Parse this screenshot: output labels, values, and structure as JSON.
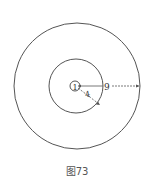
{
  "figure": {
    "caption": "图73",
    "circles": [
      {
        "name": "inner",
        "radius_label": "1",
        "cx": 76,
        "cy": 86,
        "r": 5
      },
      {
        "name": "middle",
        "radius_label": "4",
        "cx": 76,
        "cy": 86,
        "r": 27
      },
      {
        "name": "outer",
        "radius_label": "9",
        "cx": 77,
        "cy": 86,
        "r": 63
      }
    ],
    "labels": {
      "inner": "1",
      "middle": "4",
      "outer": "9"
    },
    "colors": {
      "stroke": "#555555",
      "text": "#333333",
      "background": "#ffffff"
    }
  }
}
